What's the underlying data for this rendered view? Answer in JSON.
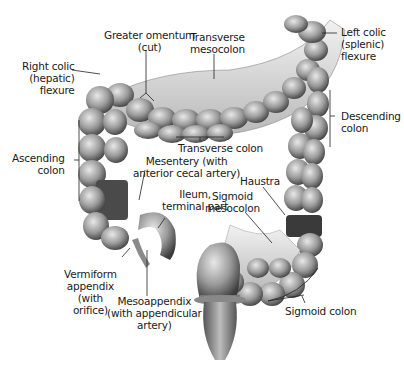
{
  "figure": {
    "labels": {
      "greater_omentum": "Greater omentum\n(cut)",
      "transverse_mesocolon": "Transverse\nmesocolon",
      "left_colic_flexure": "Left colic\n(splenic)\nflexure",
      "right_colic_flexure": "Right colic\n(hepatic)\nflexure",
      "descending_colon": "Descending\ncolon",
      "ascending_colon": "Ascending\ncolon",
      "transverse_colon": "Transverse colon",
      "mesentery": "Mesentery (with\nanterior cecal artery)",
      "haustra": "Haustra",
      "ileum": "Ileum,\nterminal part",
      "sigmoid_mesocolon": "Sigmoid\nmesocolon",
      "vermiform_appendix": "Vermiform\nappendix\n(with\norifice)",
      "mesoappendix": "Mesoappendix\n(with appendicular\nartery)",
      "sigmoid_colon": "Sigmoid colon"
    }
  }
}
